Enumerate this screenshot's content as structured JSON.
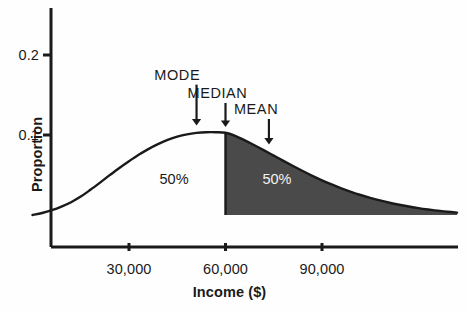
{
  "chart_data": {
    "type": "area",
    "title": "",
    "subtitle": "",
    "xlabel": "Income ($)",
    "ylabel": "Proportion",
    "xlim": [
      0,
      132000
    ],
    "ylim": [
      0,
      0.245
    ],
    "grid": false,
    "legend_position": "none",
    "x_ticks": [
      {
        "value": 30000,
        "label": "30,000"
      },
      {
        "value": 60000,
        "label": "60,000"
      },
      {
        "value": 90000,
        "label": "90,000"
      }
    ],
    "y_ticks": [
      {
        "value": 0.1,
        "label": "0.1"
      },
      {
        "value": 0.2,
        "label": "0.2"
      }
    ],
    "series": [
      {
        "name": "Income distribution",
        "type": "density",
        "x": [
          0,
          3000,
          6000,
          9000,
          12000,
          15000,
          18000,
          21000,
          24000,
          27000,
          30000,
          33000,
          36000,
          39000,
          42000,
          45000,
          48000,
          51000,
          54000,
          57000,
          60000,
          63000,
          66000,
          69000,
          72000,
          75000,
          78000,
          81000,
          84000,
          87000,
          90000,
          93000,
          96000,
          99000,
          102000,
          105000,
          108000,
          111000,
          114000,
          117000,
          120000,
          123000,
          126000,
          129000,
          132000
        ],
        "y": [
          0.0,
          0.0025,
          0.006,
          0.0105,
          0.016,
          0.023,
          0.0315,
          0.0405,
          0.0498,
          0.0588,
          0.0672,
          0.0752,
          0.0824,
          0.0886,
          0.0938,
          0.0979,
          0.1008,
          0.1026,
          0.1035,
          0.1035,
          0.1028,
          0.0989,
          0.0933,
          0.0872,
          0.0808,
          0.0742,
          0.0676,
          0.0612,
          0.055,
          0.049,
          0.0434,
          0.0382,
          0.0334,
          0.029,
          0.025,
          0.0214,
          0.0182,
          0.0153,
          0.0128,
          0.0106,
          0.0086,
          0.0069,
          0.0054,
          0.0041,
          0.003
        ]
      }
    ],
    "shaded_region": {
      "label": "upper half",
      "from": 60000,
      "to": 132000,
      "color": "#4a4a4a"
    },
    "divider_line": {
      "at": 60000,
      "color": "#1a1a1a"
    },
    "region_labels": [
      {
        "text": "50%",
        "x": 44000,
        "y": 0.045,
        "on_dark": false
      },
      {
        "text": "50%",
        "x": 76000,
        "y": 0.045,
        "on_dark": true
      }
    ],
    "annotations": [
      {
        "label": "MODE",
        "point_x": 51000,
        "label_x": 45000,
        "label_y": 0.175,
        "arrow_from_y": 0.163,
        "arrow_to_y": 0.112
      },
      {
        "label": "MEDIAN",
        "point_x": 60000,
        "label_x": 57500,
        "label_y": 0.152,
        "arrow_from_y": 0.14,
        "arrow_to_y": 0.11
      },
      {
        "label": "MEAN",
        "point_x": 73500,
        "label_x": 69500,
        "label_y": 0.132,
        "arrow_from_y": 0.12,
        "arrow_to_y": 0.088
      }
    ],
    "colors": {
      "axis": "#1a1a1a",
      "curve": "#1a1a1a",
      "fill": "#4a4a4a",
      "text": "#1a1a1a",
      "background": "#fefefe"
    }
  }
}
